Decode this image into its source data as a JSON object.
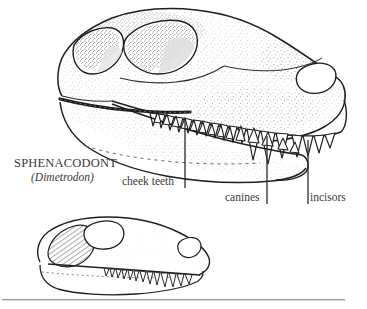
{
  "figure": {
    "kind": "scientific-illustration",
    "background_color": "#ffffff",
    "ink_color": "#2b2b2b",
    "stipple_color": "#555555",
    "labels": {
      "taxon_common": "SPHENACODONT",
      "taxon_genus": "(Dimetrodon)",
      "cheek_teeth": "cheek teeth",
      "canines": "canines",
      "incisors": "incisors"
    },
    "leader_lines": [
      {
        "name": "cheek-teeth-leader",
        "x": 185,
        "y_top": 120,
        "y_bottom": 188
      },
      {
        "name": "canines-leader",
        "x": 267,
        "y_top": 136,
        "y_bottom": 204
      },
      {
        "name": "incisors-leader",
        "x": 308,
        "y_top": 140,
        "y_bottom": 204
      }
    ],
    "specimens": [
      {
        "name": "main-skull",
        "description": "large detailed lateral view of sphenacodont skull with stippled shading, temporal fenestra, orbit, external naris and full tooth row",
        "openings": [
          "temporal-fenestra",
          "orbit",
          "external-naris"
        ]
      },
      {
        "name": "comparison-skull",
        "description": "smaller simplified lateral skull outline with hatched temporal region, orbit and tooth row",
        "openings": [
          "temporal-fenestra",
          "orbit",
          "external-naris"
        ]
      }
    ],
    "footer_rule": {
      "name": "footer-rule",
      "color": "#9a9a9a"
    }
  }
}
